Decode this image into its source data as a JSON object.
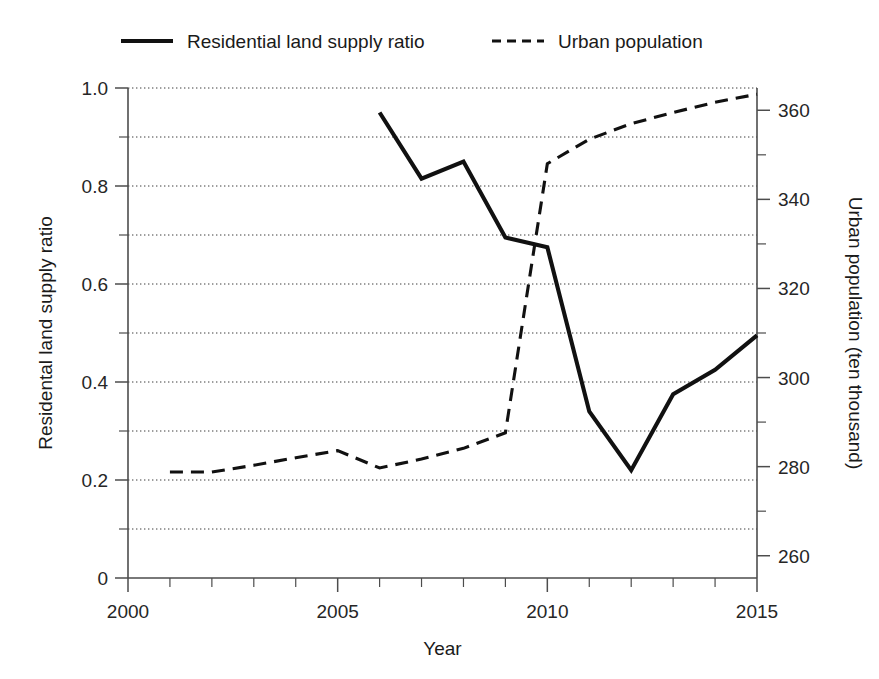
{
  "chart_data": {
    "type": "line",
    "title": "",
    "xlabel": "Year",
    "ylabel": "Residental land supply ratio",
    "y2label": "Urban population (ten thousand)",
    "xlim": [
      2000,
      2015
    ],
    "ylim": [
      0,
      1.0
    ],
    "y2lim": [
      255,
      365
    ],
    "grid": true,
    "grid_axis": "y",
    "legend_position": "top",
    "x_ticks": [
      2000,
      2005,
      2010,
      2015
    ],
    "x_tick_labels": [
      "2000",
      "2005",
      "2010",
      "2015"
    ],
    "x_minor_ticks": [
      2001,
      2002,
      2003,
      2004,
      2006,
      2007,
      2008,
      2009,
      2011,
      2012,
      2013,
      2014
    ],
    "y_ticks": [
      0,
      0.2,
      0.4,
      0.6,
      0.8,
      1.0
    ],
    "y_tick_labels": [
      "0",
      "0.2",
      "0.4",
      "0.6",
      "0.8",
      "1.0"
    ],
    "y_minor_ticks": [
      0.1,
      0.3,
      0.5,
      0.7,
      0.9
    ],
    "y2_ticks": [
      260,
      280,
      300,
      320,
      340,
      360
    ],
    "y2_tick_labels": [
      "260",
      "280",
      "300",
      "320",
      "340",
      "360"
    ],
    "y2_minor_ticks": [
      270,
      290,
      310,
      330,
      350
    ],
    "gridline_values": [
      0.1,
      0.2,
      0.3,
      0.4,
      0.5,
      0.6,
      0.7,
      0.8,
      0.9,
      1.0
    ],
    "series": [
      {
        "name": "Residential land supply ratio",
        "axis": "left",
        "style": "solid",
        "x": [
          2006,
          2007,
          2008,
          2009,
          2010,
          2011,
          2012,
          2013,
          2014,
          2015
        ],
        "values": [
          0.95,
          0.815,
          0.85,
          0.695,
          0.675,
          0.34,
          0.22,
          0.375,
          0.425,
          0.495
        ]
      },
      {
        "name": "Urban population",
        "axis": "right",
        "style": "dashed",
        "x": [
          2001,
          2002,
          2003,
          2004,
          2005,
          2006,
          2007,
          2008,
          2009,
          2010,
          2011,
          2012,
          2013,
          2014,
          2015
        ],
        "values": [
          278.8,
          278.8,
          280.3,
          282.0,
          283.6,
          279.7,
          281.7,
          284.1,
          287.6,
          348.0,
          353.5,
          357.0,
          359.5,
          361.8,
          363.6
        ]
      }
    ]
  },
  "legend": {
    "items": [
      {
        "label": "Residential land supply ratio",
        "style": "solid"
      },
      {
        "label": "Urban population",
        "style": "dashed"
      }
    ]
  }
}
